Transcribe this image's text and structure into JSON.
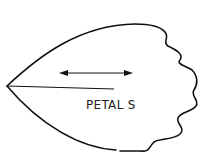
{
  "diagram": {
    "type": "sewing-pattern-piece",
    "piece_label": "PETAL S",
    "grainline": "double-headed arrow (horizontal)",
    "colors": {
      "outline": "#111111",
      "background": "#ffffff",
      "text": "#222222"
    }
  }
}
